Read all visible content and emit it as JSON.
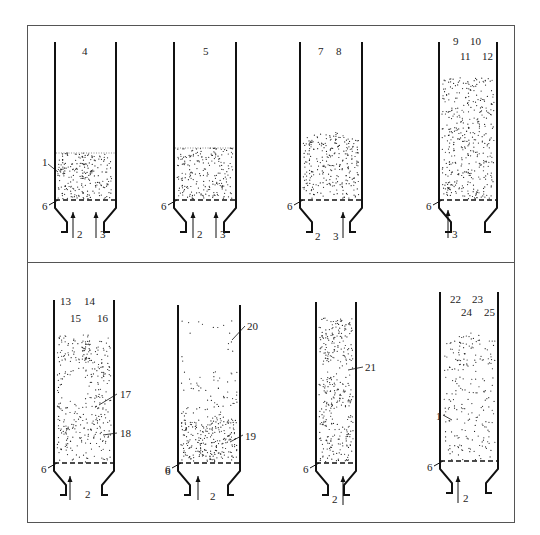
{
  "figure": {
    "panels_top": [
      {
        "id": "a",
        "labels": [
          "4"
        ],
        "bed_label": "1",
        "grid_label": "6",
        "flow_labels": [
          "2",
          "3"
        ]
      },
      {
        "id": "b",
        "labels": [
          "5"
        ],
        "grid_label": "6",
        "flow_labels": [
          "2",
          "3"
        ]
      },
      {
        "id": "c",
        "labels": [
          "7",
          "8"
        ],
        "grid_label": "6",
        "flow_labels": [
          "2",
          "3"
        ]
      },
      {
        "id": "d",
        "labels": [
          "9",
          "10",
          "11",
          "12"
        ],
        "grid_label": "6",
        "flow_labels": [
          "3"
        ]
      }
    ],
    "panels_bottom": [
      {
        "id": "e",
        "labels": [
          "13",
          "14",
          "15",
          "16"
        ],
        "callouts": [
          "17",
          "18"
        ],
        "grid_label": "6",
        "flow_labels": [
          "2"
        ]
      },
      {
        "id": "f",
        "callouts": [
          "20",
          "19"
        ],
        "grid_label": "6",
        "flow_labels": [
          "2"
        ]
      },
      {
        "id": "g",
        "callouts": [
          "21"
        ],
        "grid_label": "6",
        "flow_labels": [
          "2"
        ]
      },
      {
        "id": "h",
        "labels": [
          "22",
          "23",
          "24",
          "25"
        ],
        "bed_label": "1",
        "grid_label": "6",
        "flow_labels": [
          "2"
        ]
      }
    ]
  }
}
